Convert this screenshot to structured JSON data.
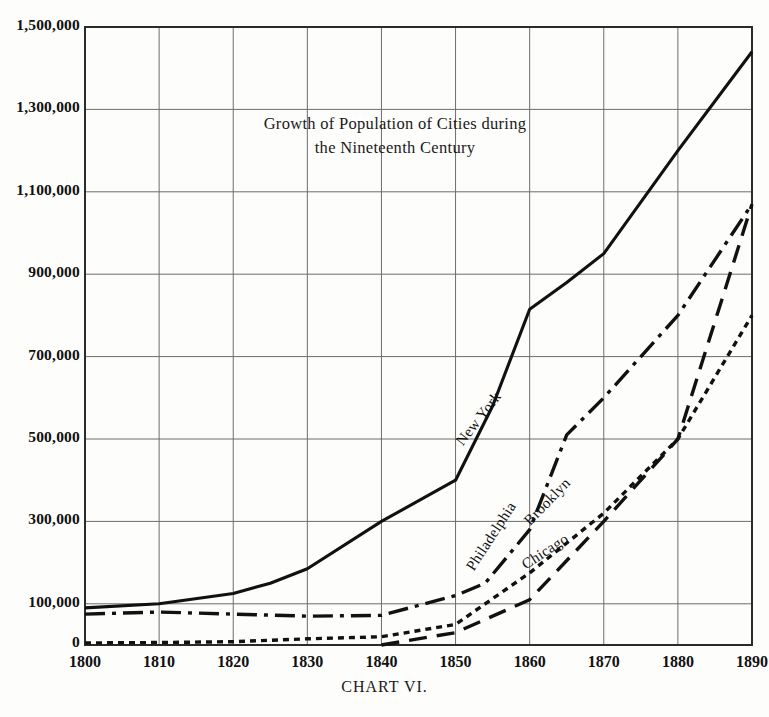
{
  "figure": {
    "caption": "CHART VI.",
    "title_lines": [
      "Growth of Population of Cities during",
      "the Nineteenth Century"
    ]
  },
  "chart_data": {
    "type": "line",
    "title": "Growth of Population of Cities during the Nineteenth Century",
    "xlabel": "",
    "ylabel": "",
    "xlim": [
      1800,
      1890
    ],
    "ylim": [
      0,
      1500000
    ],
    "grid": true,
    "legend_position": "inline-labels",
    "x_ticks": [
      1800,
      1810,
      1820,
      1830,
      1840,
      1850,
      1860,
      1870,
      1880,
      1890
    ],
    "x_tick_labels": [
      "1800",
      "1810",
      "1820",
      "1830",
      "1840",
      "1850",
      "1860",
      "1870",
      "1880",
      "1890"
    ],
    "y_ticks": [
      0,
      100000,
      300000,
      500000,
      700000,
      900000,
      1100000,
      1300000,
      1500000
    ],
    "y_tick_labels": [
      "0",
      "100,000",
      "300,000",
      "500,000",
      "700,000",
      "900,000",
      "1,100,000",
      "1,300,000",
      "1,500,000"
    ],
    "series": [
      {
        "name": "New York",
        "style": "solid",
        "color": "#111111",
        "x": [
          1800,
          1810,
          1820,
          1825,
          1830,
          1840,
          1850,
          1855,
          1860,
          1865,
          1870,
          1880,
          1890
        ],
        "values": [
          90000,
          100000,
          125000,
          150000,
          185000,
          300000,
          400000,
          580000,
          815000,
          880000,
          950000,
          1200000,
          1440000
        ]
      },
      {
        "name": "Philadelphia",
        "style": "dashdot",
        "color": "#111111",
        "x": [
          1800,
          1810,
          1820,
          1830,
          1840,
          1850,
          1854,
          1860,
          1865,
          1870,
          1880,
          1890
        ],
        "values": [
          75000,
          80000,
          75000,
          70000,
          72000,
          120000,
          150000,
          280000,
          510000,
          600000,
          800000,
          1070000
        ]
      },
      {
        "name": "Brooklyn",
        "style": "dotted",
        "color": "#111111",
        "x": [
          1800,
          1810,
          1820,
          1830,
          1840,
          1850,
          1860,
          1870,
          1880,
          1890
        ],
        "values": [
          5000,
          6000,
          8000,
          15000,
          20000,
          50000,
          175000,
          320000,
          500000,
          800000
        ]
      },
      {
        "name": "Chicago",
        "style": "longdash",
        "color": "#111111",
        "x": [
          1840,
          1850,
          1860,
          1870,
          1880,
          1890
        ],
        "values": [
          0,
          30000,
          110000,
          300000,
          500000,
          1070000
        ]
      }
    ],
    "series_labels": [
      {
        "name": "New York",
        "text": "New York"
      },
      {
        "name": "Philadelphia",
        "text": "Philadelphia"
      },
      {
        "name": "Brooklyn",
        "text": "Brooklyn"
      },
      {
        "name": "Chicago",
        "text": "Chicago"
      }
    ]
  }
}
